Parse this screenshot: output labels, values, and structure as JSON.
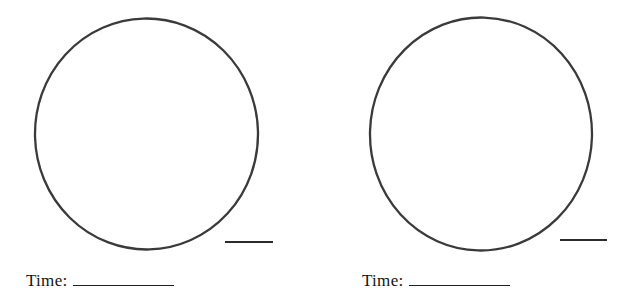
{
  "colors": {
    "background": "#ffffff",
    "circle_stroke": "#3a3a3a",
    "dash_stroke": "#2b2b2b",
    "text": "#141414"
  },
  "clocks": [
    {
      "time_label": "Time:",
      "time_value": ""
    },
    {
      "time_label": "Time:",
      "time_value": ""
    }
  ]
}
